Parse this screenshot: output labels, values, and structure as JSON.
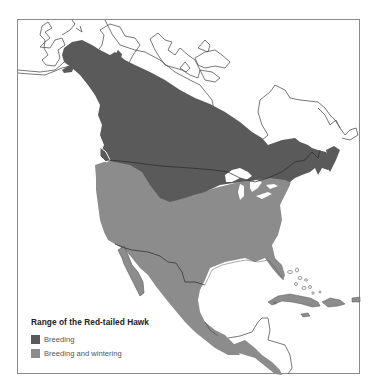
{
  "map": {
    "title": "Range of the Red-tailed Hawk",
    "colors": {
      "breeding": "#5a5a5a",
      "breeding_and_wintering": "#8c8c8c",
      "coastline": "#555555",
      "border": "#2a2a2a",
      "frame": "#8a8a8a"
    },
    "legend": {
      "items": [
        {
          "label": "Breeding",
          "color": "#5a5a5a"
        },
        {
          "label": "Breeding and wintering",
          "color": "#8c8c8c"
        }
      ]
    }
  }
}
